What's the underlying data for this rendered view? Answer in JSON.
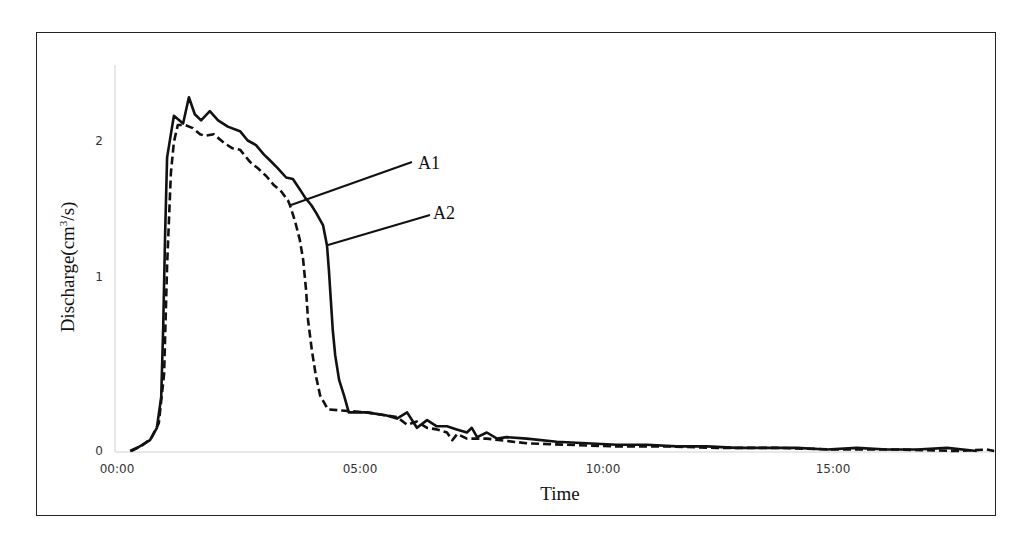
{
  "chart_data": {
    "type": "line",
    "title": "",
    "xlabel": "Time",
    "ylabel": "Discharge(cm³/s)",
    "ylabel_parts": {
      "base": "Discharge(cm",
      "sup": "3",
      "tail": "/s)"
    },
    "x_unit": "minutes",
    "xlim": [
      0,
      18.1
    ],
    "ylim": [
      0,
      2.4
    ],
    "grid": false,
    "legend": "none (inline annotations A1, A2 with leader lines)",
    "x_ticks": [
      {
        "label": "00:00",
        "value": 0,
        "px": 117
      },
      {
        "label": "05:00",
        "value": 5,
        "px": 360
      },
      {
        "label": "10:00",
        "value": 10,
        "px": 603
      },
      {
        "label": "15:00",
        "value": 15,
        "px": 833
      }
    ],
    "y_ticks": [
      {
        "label": "0",
        "value": 0,
        "py": 451
      },
      {
        "label": "1",
        "value": 1,
        "py": 277
      },
      {
        "label": "2",
        "value": 2,
        "py": 141
      }
    ],
    "series": [
      {
        "name": "A1",
        "style": "dashed",
        "color": "#111111",
        "points": [
          [
            0.29,
            0.0
          ],
          [
            0.49,
            0.03
          ],
          [
            0.7,
            0.08
          ],
          [
            0.86,
            0.18
          ],
          [
            0.97,
            0.5
          ],
          [
            1.03,
            1.2
          ],
          [
            1.11,
            1.8
          ],
          [
            1.17,
            2.0
          ],
          [
            1.25,
            2.11
          ],
          [
            1.4,
            2.11
          ],
          [
            1.56,
            2.09
          ],
          [
            1.71,
            2.05
          ],
          [
            1.81,
            2.04
          ],
          [
            1.99,
            2.05
          ],
          [
            2.22,
            1.99
          ],
          [
            2.37,
            1.96
          ],
          [
            2.53,
            1.95
          ],
          [
            2.74,
            1.87
          ],
          [
            2.9,
            1.83
          ],
          [
            3.07,
            1.78
          ],
          [
            3.23,
            1.72
          ],
          [
            3.38,
            1.68
          ],
          [
            3.52,
            1.62
          ],
          [
            3.56,
            1.59
          ],
          [
            3.66,
            1.49
          ],
          [
            3.76,
            1.37
          ],
          [
            3.83,
            1.24
          ],
          [
            3.89,
            1.04
          ],
          [
            3.93,
            0.85
          ],
          [
            4.01,
            0.65
          ],
          [
            4.09,
            0.49
          ],
          [
            4.18,
            0.36
          ],
          [
            4.34,
            0.27
          ],
          [
            4.69,
            0.26
          ],
          [
            5.14,
            0.25
          ],
          [
            5.55,
            0.23
          ],
          [
            5.76,
            0.22
          ],
          [
            5.97,
            0.17
          ],
          [
            6.17,
            0.19
          ],
          [
            6.38,
            0.15
          ],
          [
            6.58,
            0.14
          ],
          [
            6.79,
            0.12
          ],
          [
            6.9,
            0.07
          ],
          [
            7.0,
            0.11
          ],
          [
            7.2,
            0.08
          ],
          [
            7.61,
            0.08
          ],
          [
            8.43,
            0.05
          ],
          [
            9.25,
            0.04
          ],
          [
            10.28,
            0.03
          ],
          [
            11.31,
            0.03
          ],
          [
            12.34,
            0.02
          ],
          [
            13.58,
            0.02
          ],
          [
            14.81,
            0.01
          ],
          [
            16.05,
            0.01
          ],
          [
            17.29,
            0.0
          ],
          [
            17.9,
            0.01
          ],
          [
            18.05,
            0.0
          ]
        ]
      },
      {
        "name": "A2",
        "style": "solid",
        "color": "#111111",
        "points": [
          [
            0.27,
            0.0
          ],
          [
            0.47,
            0.03
          ],
          [
            0.68,
            0.07
          ],
          [
            0.82,
            0.15
          ],
          [
            0.91,
            0.35
          ],
          [
            0.95,
            0.8
          ],
          [
            0.99,
            1.4
          ],
          [
            1.03,
            1.9
          ],
          [
            1.17,
            2.17
          ],
          [
            1.36,
            2.12
          ],
          [
            1.48,
            2.29
          ],
          [
            1.6,
            2.18
          ],
          [
            1.73,
            2.14
          ],
          [
            1.91,
            2.2
          ],
          [
            2.08,
            2.14
          ],
          [
            2.28,
            2.1
          ],
          [
            2.53,
            2.07
          ],
          [
            2.69,
            2.01
          ],
          [
            2.86,
            1.98
          ],
          [
            3.02,
            1.92
          ],
          [
            3.15,
            1.88
          ],
          [
            3.31,
            1.83
          ],
          [
            3.48,
            1.77
          ],
          [
            3.62,
            1.76
          ],
          [
            3.77,
            1.69
          ],
          [
            3.87,
            1.64
          ],
          [
            4.0,
            1.59
          ],
          [
            4.1,
            1.54
          ],
          [
            4.24,
            1.46
          ],
          [
            4.32,
            1.33
          ],
          [
            4.36,
            1.17
          ],
          [
            4.4,
            0.98
          ],
          [
            4.44,
            0.78
          ],
          [
            4.49,
            0.62
          ],
          [
            4.57,
            0.46
          ],
          [
            4.67,
            0.36
          ],
          [
            4.77,
            0.25
          ],
          [
            5.14,
            0.25
          ],
          [
            5.55,
            0.23
          ],
          [
            5.76,
            0.21
          ],
          [
            5.97,
            0.25
          ],
          [
            6.17,
            0.15
          ],
          [
            6.38,
            0.2
          ],
          [
            6.58,
            0.16
          ],
          [
            6.79,
            0.16
          ],
          [
            6.99,
            0.14
          ],
          [
            7.2,
            0.12
          ],
          [
            7.3,
            0.15
          ],
          [
            7.41,
            0.09
          ],
          [
            7.61,
            0.12
          ],
          [
            7.82,
            0.08
          ],
          [
            8.02,
            0.09
          ],
          [
            8.43,
            0.08
          ],
          [
            9.05,
            0.06
          ],
          [
            9.66,
            0.05
          ],
          [
            10.28,
            0.04
          ],
          [
            10.9,
            0.04
          ],
          [
            11.52,
            0.03
          ],
          [
            12.14,
            0.03
          ],
          [
            12.75,
            0.02
          ],
          [
            13.37,
            0.02
          ],
          [
            13.99,
            0.02
          ],
          [
            14.61,
            0.01
          ],
          [
            15.22,
            0.02
          ],
          [
            15.84,
            0.01
          ],
          [
            16.46,
            0.01
          ],
          [
            17.08,
            0.02
          ],
          [
            17.69,
            0.0
          ]
        ]
      }
    ],
    "annotations": [
      {
        "text": "A1",
        "target_series": "A1",
        "leader_from": [
          291,
          205
        ],
        "leader_to": [
          412,
          162
        ],
        "text_x": 418,
        "text_y": 170
      },
      {
        "text": "A2",
        "target_series": "A2",
        "leader_from": [
          328,
          245
        ],
        "leader_to": [
          430,
          215
        ],
        "text_x": 433,
        "text_y": 220
      }
    ]
  },
  "layout": {
    "frame": {
      "left": 36,
      "top": 32,
      "right": 997,
      "bottom": 517
    },
    "plot": {
      "x0_px": 117,
      "px_per_min": 48.6,
      "y0_px": 451,
      "px_per_unit": 154.5,
      "axis_x_px": 115,
      "axis_top_px": 65,
      "x_end_px": 995
    }
  }
}
